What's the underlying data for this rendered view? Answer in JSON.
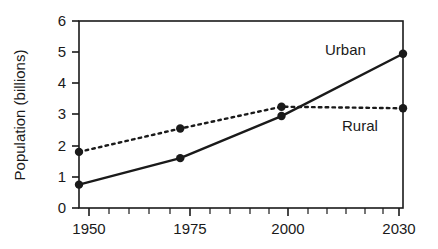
{
  "chart_data": {
    "type": "line",
    "title": "",
    "subtitle": "",
    "xlabel": "",
    "ylabel": "Population (billions)",
    "x": [
      1950,
      1975,
      2000,
      2030
    ],
    "xticklabels": [
      "1950",
      "1975",
      "2000",
      "2030"
    ],
    "yticklabels": [
      "0",
      "1",
      "2",
      "3",
      "4",
      "5",
      "6"
    ],
    "xlim": [
      1950,
      2030
    ],
    "ylim": [
      0,
      6
    ],
    "grid": false,
    "legend_position": "inline-annotation",
    "series": [
      {
        "name": "Urban",
        "label": "Urban",
        "linestyle": "solid",
        "color": "#1a1a1a",
        "marker": "circle",
        "values": [
          0.75,
          1.6,
          2.95,
          4.95
        ]
      },
      {
        "name": "Rural",
        "label": "Rural",
        "linestyle": "dotted",
        "color": "#1a1a1a",
        "marker": "circle",
        "values": [
          1.8,
          2.55,
          3.25,
          3.2
        ]
      }
    ],
    "annotations": [
      {
        "text": "Urban",
        "x": 2000,
        "y": 5.35
      },
      {
        "text": "Rural",
        "x": 2012,
        "y": 2.85
      }
    ],
    "minor_xticks_interval": 5,
    "axis_color": "#1a1a1a",
    "background_color": "#ffffff"
  }
}
